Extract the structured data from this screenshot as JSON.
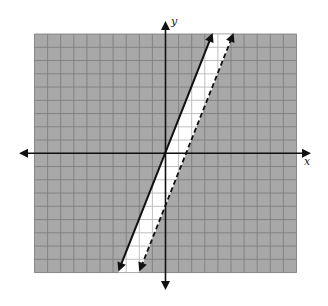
{
  "chart_data": {
    "type": "line",
    "title": "",
    "xlabel": "x",
    "ylabel": "y",
    "xlim": [
      -10,
      10
    ],
    "ylim": [
      -9,
      9
    ],
    "grid": true,
    "grid_step": 1,
    "legend": null,
    "series": [
      {
        "name": "boundary-solid",
        "equation": "y = 2.5x",
        "slope": 2.5,
        "intercept": 0,
        "style": "solid",
        "inclusive": true
      },
      {
        "name": "boundary-dashed",
        "equation": "y = 2.5x - 4",
        "slope": 2.5,
        "intercept": -4,
        "style": "dashed",
        "inclusive": false
      }
    ],
    "shaded_region": {
      "description": "Region outside the band between the two parallel lines is shaded gray; the band between them (2.5x - 4 < y <= 2.5x) is unshaded/white",
      "band_fill": "#ffffff",
      "outside_fill": "#a8a8a8"
    }
  },
  "colors": {
    "shade": "#a8a8a8",
    "grid_dark": "#7f7f7f",
    "grid_light": "#b8b8b8",
    "band": "#ffffff",
    "axis": "#111111",
    "line": "#111111"
  },
  "labels": {
    "x_axis": "x",
    "y_axis": "y"
  }
}
